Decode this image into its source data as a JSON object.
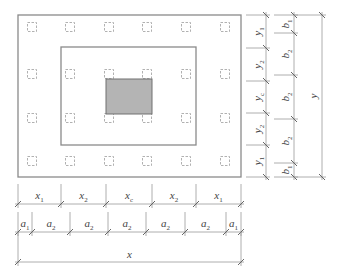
{
  "diagram": {
    "colors": {
      "line": "#8a8a8a",
      "dim_line": "#9a9a9a",
      "column_dash": "#a8a8a8",
      "core_fill": "#b4b4b4",
      "core_stroke": "#707070",
      "text": "#444444"
    },
    "outer_rect": {
      "x": 18,
      "y": 15,
      "w": 223,
      "h": 162
    },
    "inner_rect": {
      "x": 61,
      "y": 47,
      "w": 135,
      "h": 98
    },
    "core_rect": {
      "x": 106,
      "y": 79,
      "w": 46,
      "h": 35
    },
    "column_grid": {
      "xs": [
        32,
        70,
        109,
        147,
        186,
        225
      ],
      "ys": [
        27,
        74,
        118,
        161
      ],
      "size": 9
    },
    "dims_bottom": {
      "x_row": {
        "y": 204,
        "ticks": [
          18,
          61,
          106,
          152,
          196,
          241
        ],
        "labels": [
          {
            "base": "x",
            "sub": "1"
          },
          {
            "base": "x",
            "sub": "2"
          },
          {
            "base": "x",
            "sub": "c"
          },
          {
            "base": "x",
            "sub": "2"
          },
          {
            "base": "x",
            "sub": "1"
          }
        ]
      },
      "a_row": {
        "y": 232,
        "ticks": [
          18,
          32,
          70,
          108,
          146,
          185,
          226,
          241
        ],
        "labels": [
          {
            "base": "a",
            "sub": "1"
          },
          {
            "base": "a",
            "sub": "2"
          },
          {
            "base": "a",
            "sub": "2"
          },
          {
            "base": "a",
            "sub": "2"
          },
          {
            "base": "a",
            "sub": "2"
          },
          {
            "base": "a",
            "sub": "2"
          },
          {
            "base": "a",
            "sub": "1"
          }
        ]
      },
      "total_row": {
        "y": 262,
        "ticks": [
          18,
          241
        ],
        "label": {
          "base": "x",
          "sub": ""
        }
      }
    },
    "dims_right": {
      "y_col": {
        "x": 266,
        "ticks": [
          15,
          48,
          81,
          113,
          145,
          177
        ],
        "labels": [
          {
            "base": "y",
            "sub": "1"
          },
          {
            "base": "y",
            "sub": "2"
          },
          {
            "base": "y",
            "sub": "c"
          },
          {
            "base": "y",
            "sub": "2"
          },
          {
            "base": "y",
            "sub": "1"
          }
        ]
      },
      "b_col": {
        "x": 294,
        "ticks": [
          15,
          33,
          75,
          119,
          163,
          177
        ],
        "labels": [
          {
            "base": "b",
            "sub": "1"
          },
          {
            "base": "b",
            "sub": "2"
          },
          {
            "base": "b",
            "sub": "2"
          },
          {
            "base": "b",
            "sub": "2"
          },
          {
            "base": "b",
            "sub": "1"
          }
        ]
      },
      "total_col": {
        "x": 322,
        "ticks": [
          15,
          177
        ],
        "label": {
          "base": "y",
          "sub": ""
        }
      }
    }
  }
}
